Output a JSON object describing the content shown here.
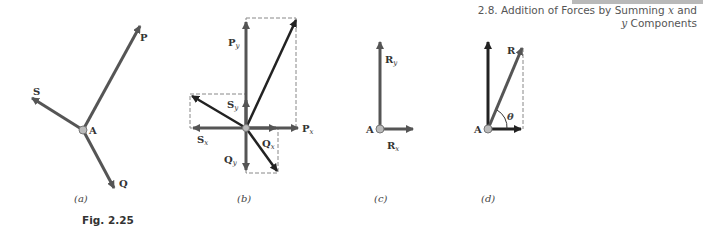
{
  "header": {
    "section_line1": "2.8. Addition of Forces by Summing ",
    "section_x": "x",
    "section_line1_end": " and",
    "section_y": "y",
    "section_line2_end": " Components"
  },
  "figure": {
    "label": "Fig. 2.25",
    "panels": [
      {
        "caption": "(a)",
        "point": "A",
        "vectors": [
          "P",
          "S",
          "Q"
        ]
      },
      {
        "caption": "(b)",
        "components": [
          "P",
          "x",
          "P",
          "y",
          "S",
          "x",
          "S",
          "y",
          "Q",
          "x",
          "Q",
          "y"
        ]
      },
      {
        "caption": "(c)",
        "point": "A",
        "components": [
          "R",
          "x",
          "R",
          "y"
        ]
      },
      {
        "caption": "(d)",
        "point": "A",
        "resultant": "R",
        "angle": "θ"
      }
    ]
  },
  "colors": {
    "vector": "#555555",
    "dark_vector": "#222222",
    "dash": "#888888",
    "point": "#bbbbbb"
  }
}
